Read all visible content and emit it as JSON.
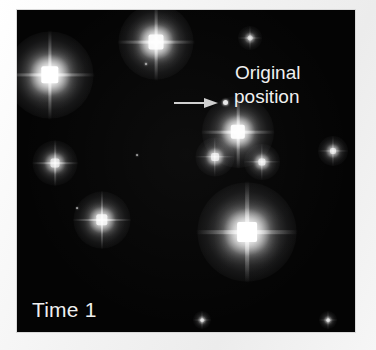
{
  "figure": {
    "panel_label": "Time 1",
    "background_color": "#040404",
    "margin_color": "#f3f3f3",
    "star_color": "#ffffff",
    "annotation": {
      "line1": "Original",
      "line2": "position",
      "arrow": "right-arrow",
      "marker": "origin-dot"
    }
  },
  "chart_data": {
    "type": "scatter",
    "title": "Time 1",
    "xlabel": "",
    "ylabel": "",
    "xlim": [
      0,
      338
    ],
    "ylim": [
      0,
      322
    ],
    "grid": false,
    "legend": null,
    "annotations": [
      {
        "text": "Original position",
        "x": 191,
        "y": 82,
        "arrow_from_x": 140,
        "arrow_from_y": 82,
        "marker_x": 191,
        "marker_y": 82
      },
      {
        "text": "Time 1",
        "x": 15,
        "y": 298
      }
    ],
    "series": [
      {
        "name": "stars",
        "points": [
          {
            "x": 33,
            "y": 65,
            "brightness": 1.0,
            "size": 58,
            "id": "star-upper-left-bright"
          },
          {
            "x": 139,
            "y": 32,
            "brightness": 0.92,
            "size": 50,
            "id": "star-top-center"
          },
          {
            "x": 233,
            "y": 28,
            "brightness": 0.38,
            "size": 16,
            "id": "star-top-right-faint"
          },
          {
            "x": 38,
            "y": 153,
            "brightness": 0.62,
            "size": 30,
            "id": "star-mid-left"
          },
          {
            "x": 221,
            "y": 122,
            "brightness": 0.95,
            "size": 48,
            "id": "star-cluster-top"
          },
          {
            "x": 198,
            "y": 147,
            "brightness": 0.66,
            "size": 26,
            "id": "star-cluster-left"
          },
          {
            "x": 245,
            "y": 152,
            "brightness": 0.62,
            "size": 24,
            "id": "star-cluster-right"
          },
          {
            "x": 316,
            "y": 141,
            "brightness": 0.55,
            "size": 20,
            "id": "star-right-edge"
          },
          {
            "x": 85,
            "y": 210,
            "brightness": 0.8,
            "size": 38,
            "id": "star-lower-left"
          },
          {
            "x": 230,
            "y": 222,
            "brightness": 1.0,
            "size": 66,
            "id": "star-lower-center-bright"
          },
          {
            "x": 185,
            "y": 310,
            "brightness": 0.35,
            "size": 12,
            "id": "star-bottom-left-faint"
          },
          {
            "x": 311,
            "y": 310,
            "brightness": 0.35,
            "size": 12,
            "id": "star-bottom-right-faint"
          },
          {
            "x": 129,
            "y": 54,
            "brightness": 0.1,
            "size": 4,
            "id": "star-tiny-a"
          },
          {
            "x": 120,
            "y": 145,
            "brightness": 0.08,
            "size": 3,
            "id": "star-tiny-b"
          },
          {
            "x": 60,
            "y": 198,
            "brightness": 0.08,
            "size": 3,
            "id": "star-tiny-c"
          }
        ]
      }
    ]
  }
}
